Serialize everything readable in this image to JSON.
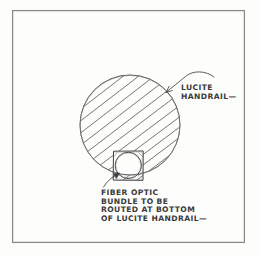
{
  "drawing": {
    "title": "Lucite handrail fiber optic detail sketch",
    "medium": "hand-drawn pencil sketch",
    "background_color": "#fdfdfc",
    "ink_color": "#3c3c3c",
    "frame": {
      "name": "drawing-border",
      "x": 12,
      "y": 10,
      "width": 233,
      "height": 233,
      "stroke_color": "#6e6e6e"
    },
    "handrail": {
      "name": "lucite-handrail-section",
      "shape": "circle",
      "center_x": 130,
      "center_y": 125,
      "radius": 50,
      "hatch": {
        "name": "section-hatching",
        "angle_degrees": -38,
        "line_count": 13,
        "spacing": 8.5
      }
    },
    "conduit": {
      "name": "fiber-optic-conduit",
      "square": {
        "x": 113,
        "y": 151,
        "width": 30,
        "height": 29
      },
      "circle": {
        "center_x": 128,
        "center_y": 165,
        "radius": 13
      }
    },
    "callouts": [
      {
        "id": "handrail-callout",
        "lines": [
          "LUCITE",
          "HANDRAIL—"
        ],
        "text_x": 180,
        "text_y": 88,
        "leader": {
          "from_x": 212,
          "from_y": 78,
          "to_x": 165,
          "to_y": 93,
          "arrow": "down-left"
        }
      },
      {
        "id": "fiber-optic-callout",
        "lines": [
          "FIBER OPTIC",
          "BUNDLE TO BE",
          "ROUTED AT BOTTOM",
          "OF LUCITE HANDRAIL—"
        ],
        "text_x": 101,
        "text_y": 193,
        "leader": {
          "from_x": 104,
          "from_y": 186,
          "to_x": 119,
          "to_y": 174,
          "arrow": "up-right"
        }
      }
    ]
  }
}
